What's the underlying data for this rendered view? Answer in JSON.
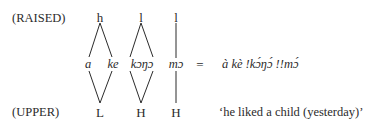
{
  "rows": {
    "top_label": "(RAISED)",
    "bottom_label": "(UPPER)"
  },
  "top_tones": [
    "h",
    "l",
    "l"
  ],
  "segments": [
    "a",
    "ke",
    "kɔŋɔ",
    "mɔ"
  ],
  "bottom_tones": [
    "L",
    "H",
    "H"
  ],
  "equals": "=",
  "transcription": "à kè !kɔ́ŋɔ́ !!mɔ́",
  "gloss": "‘he liked a child (yesterday)’"
}
